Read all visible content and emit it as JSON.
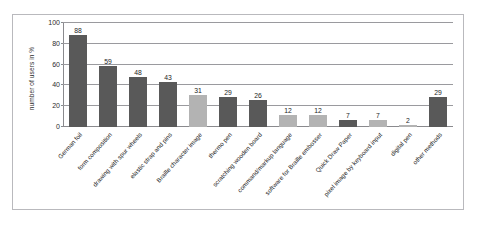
{
  "chart_data": {
    "type": "bar",
    "title": "",
    "xlabel": "",
    "ylabel": "number of users in %",
    "ylim": [
      0,
      100
    ],
    "yticks": [
      0,
      20,
      40,
      60,
      80,
      100
    ],
    "grid": true,
    "legend": "none",
    "categories": [
      "German foil",
      "form composition",
      "drawing with spur wheels",
      "elastic strap and pins",
      "Braille character image",
      "thermo pen",
      "scratching wooden board",
      "command/markup language",
      "software for Braille embosser",
      "Quick Draw Paper",
      "pixel image by keyboard input",
      "digital pen",
      "other methods"
    ],
    "values": [
      88,
      59,
      48,
      43,
      31,
      29,
      26,
      12,
      12,
      7,
      7,
      2,
      29
    ],
    "bar_colors": [
      "dark",
      "dark",
      "dark",
      "dark",
      "light",
      "dark",
      "dark",
      "light",
      "light",
      "dark",
      "light",
      "light",
      "dark"
    ],
    "colors": {
      "dark_bar": "#595959",
      "light_bar": "#b3b3b3",
      "gridline": "#9a9a9e",
      "frame_border": "#b9b9bd",
      "background": "#ffffff",
      "text": "#1e1e1e"
    }
  }
}
